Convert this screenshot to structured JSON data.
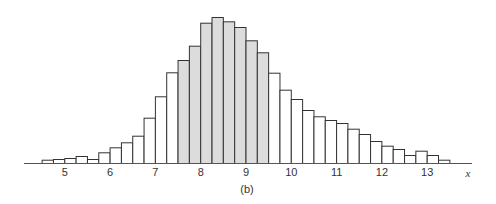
{
  "chart_data": {
    "type": "bar",
    "title": "",
    "caption": "(b)",
    "xlabel": "x",
    "ylabel": "",
    "bin_width": 0.25,
    "bin_start": 4.5,
    "xlim": [
      4.0,
      13.9
    ],
    "x_ticks": [
      5,
      6,
      7,
      8,
      9,
      10,
      11,
      12,
      13
    ],
    "x_tick_labels": [
      "5",
      "6",
      "7",
      "8",
      "9",
      "10",
      "11",
      "12",
      "13"
    ],
    "shaded_range": [
      7.5,
      9.5
    ],
    "y_axis_visible": false,
    "grid": false,
    "legend": null,
    "bins": [
      4.5,
      4.75,
      5.0,
      5.25,
      5.5,
      5.75,
      6.0,
      6.25,
      6.5,
      6.75,
      7.0,
      7.25,
      7.5,
      7.75,
      8.0,
      8.25,
      8.5,
      8.75,
      9.0,
      9.25,
      9.5,
      9.75,
      10.0,
      10.25,
      10.5,
      10.75,
      11.0,
      11.25,
      11.5,
      11.75,
      12.0,
      12.25,
      12.5,
      12.75,
      13.0,
      13.25
    ],
    "values": [
      3.3,
      4,
      5,
      7,
      4,
      10.7,
      15.7,
      20.7,
      27.3,
      45.3,
      66.7,
      90.7,
      103,
      117.3,
      140.3,
      146,
      141.7,
      136,
      122.7,
      110.7,
      90.3,
      73.3,
      64,
      53,
      46.7,
      43,
      40,
      34.3,
      29,
      22,
      17.3,
      14,
      8,
      12.3,
      8,
      3.3
    ],
    "colors": {
      "shaded_fill": "#dcdcdc",
      "unshaded_fill": "#ffffff",
      "stroke": "#333333",
      "axis": "#555555"
    }
  }
}
